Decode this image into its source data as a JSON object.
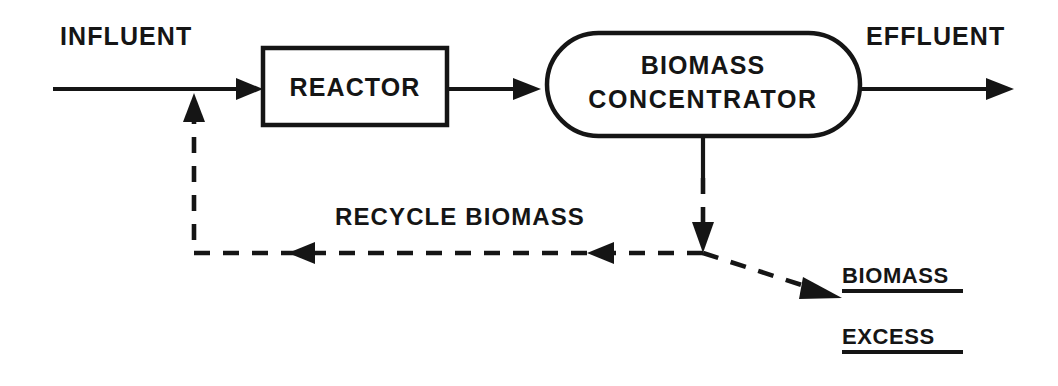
{
  "diagram": {
    "type": "process-flow-diagram",
    "background_color": "#ffffff",
    "stroke_color": "#151515",
    "canvas": {
      "width": 1058,
      "height": 386
    },
    "units": [
      {
        "id": "reactor",
        "label": "REACTOR",
        "shape": "rectangle",
        "x": 263,
        "y": 48,
        "width": 184,
        "height": 77
      },
      {
        "id": "biomass-concentrator",
        "label_line1": "BIOMASS",
        "label_line2": "CONCENTRATOR",
        "shape": "stadium",
        "x": 547,
        "y": 33,
        "width": 313,
        "height": 103
      }
    ],
    "stream_labels": {
      "influent": "INFLUENT",
      "effluent": "EFFLUENT",
      "recycle": "RECYCLE BIOMASS",
      "excess_numerator": "BIOMASS",
      "excess_denominator": "EXCESS"
    },
    "streams": [
      {
        "id": "influent-feed",
        "from": "inlet",
        "to": "reactor",
        "style": "solid",
        "direction": "right"
      },
      {
        "id": "reactor-to-concentrator",
        "from": "reactor",
        "to": "biomass-concentrator",
        "style": "solid",
        "direction": "right"
      },
      {
        "id": "effluent-out",
        "from": "biomass-concentrator",
        "to": "outlet",
        "style": "solid",
        "direction": "right"
      },
      {
        "id": "underflow-drop",
        "from": "biomass-concentrator",
        "to": "split-junction",
        "style": "solid-then-dashed",
        "direction": "down"
      },
      {
        "id": "recycle-return",
        "from": "split-junction",
        "to": "influent-feed",
        "style": "dashed",
        "direction": "left-then-up"
      },
      {
        "id": "excess-waste",
        "from": "split-junction",
        "to": "excess-biomass",
        "style": "dashed",
        "direction": "down-right"
      }
    ]
  }
}
